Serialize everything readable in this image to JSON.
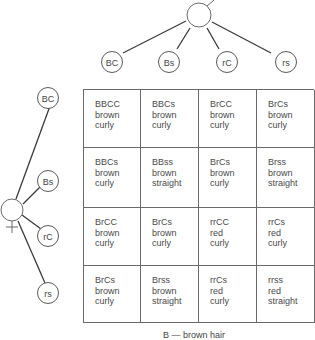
{
  "male_parent": {
    "symbol": "male-symbol"
  },
  "female_parent": {
    "symbol": "female-symbol"
  },
  "male_gametes": [
    "BC",
    "Bs",
    "rC",
    "rs"
  ],
  "female_gametes": [
    "BC",
    "Bs",
    "rC",
    "rs"
  ],
  "grid": [
    [
      {
        "genotype": "BBCC",
        "color": "brown",
        "texture": "curly"
      },
      {
        "genotype": "BBCs",
        "color": "brown",
        "texture": "curly"
      },
      {
        "genotype": "BrCC",
        "color": "brown",
        "texture": "curly"
      },
      {
        "genotype": "BrCs",
        "color": "brown",
        "texture": "curly"
      }
    ],
    [
      {
        "genotype": "BBCs",
        "color": "brown",
        "texture": "curly"
      },
      {
        "genotype": "BBss",
        "color": "brown",
        "texture": "straight"
      },
      {
        "genotype": "BrCs",
        "color": "brown",
        "texture": "curly"
      },
      {
        "genotype": "Brss",
        "color": "brown",
        "texture": "straight"
      }
    ],
    [
      {
        "genotype": "BrCC",
        "color": "brown",
        "texture": "curly"
      },
      {
        "genotype": "BrCs",
        "color": "brown",
        "texture": "curly"
      },
      {
        "genotype": "rrCC",
        "color": "red",
        "texture": "curly"
      },
      {
        "genotype": "rrCs",
        "color": "red",
        "texture": "curly"
      }
    ],
    [
      {
        "genotype": "BrCs",
        "color": "brown",
        "texture": "curly"
      },
      {
        "genotype": "Brss",
        "color": "brown",
        "texture": "straight"
      },
      {
        "genotype": "rrCs",
        "color": "red",
        "texture": "curly"
      },
      {
        "genotype": "rrss",
        "color": "red",
        "texture": "straight"
      }
    ]
  ],
  "legend": {
    "line1": "B — brown hair"
  }
}
